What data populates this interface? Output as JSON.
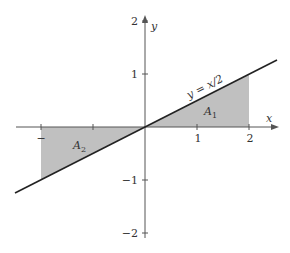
{
  "figure": {
    "type": "diagram",
    "colors": {
      "fill": "#c0c0c0",
      "line": "#222222",
      "axis": "#555555",
      "text": "#333333"
    },
    "axes": {
      "x_label": "x",
      "y_label": "y",
      "x_ticks": [
        {
          "value": -2,
          "label": "−"
        },
        {
          "value": 1,
          "label": "1"
        },
        {
          "value": 2,
          "label": "2"
        }
      ],
      "y_ticks": [
        {
          "value": 2,
          "label": "2"
        },
        {
          "value": 1,
          "label": "1"
        },
        {
          "value": -1,
          "label": "−1"
        },
        {
          "value": -2,
          "label": "−2"
        }
      ],
      "x_range": [
        -2.5,
        2.5
      ],
      "y_range": [
        -2,
        2
      ]
    },
    "curve": {
      "equation_label": "y = x/2",
      "x_start": -2.5,
      "x_end": 2.5
    },
    "regions": [
      {
        "name": "A1",
        "label_base": "A",
        "label_sub": "1",
        "x_from": 0,
        "x_to": 2
      },
      {
        "name": "A2",
        "label_base": "A",
        "label_sub": "2",
        "x_from": -2,
        "x_to": 0
      }
    ]
  }
}
